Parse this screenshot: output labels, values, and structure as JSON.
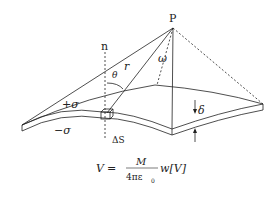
{
  "diagram": {
    "labels": {
      "point": "P",
      "normal": "n",
      "radius": "r",
      "angle_theta": "θ",
      "solid_angle": "ω",
      "plus_sigma": "+σ",
      "minus_sigma": "−σ",
      "thickness": "δ",
      "area_element": "ΔS"
    },
    "formula": {
      "lhs": "V",
      "equals": "=",
      "numerator": "M",
      "denominator": "4πε",
      "denominator_sub": "0",
      "tail": "w[V]"
    },
    "colors": {
      "line": "#222222",
      "background": "#ffffff"
    }
  }
}
